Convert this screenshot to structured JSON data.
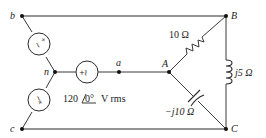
{
  "diagram": {
    "type": "three-phase-circuit",
    "nodes": {
      "b": {
        "label": "b",
        "x": 22,
        "y": 16
      },
      "n": {
        "label": "n",
        "x": 55,
        "y": 72
      },
      "c": {
        "label": "c",
        "x": 22,
        "y": 129
      },
      "a": {
        "label": "a",
        "x": 119,
        "y": 72
      },
      "A": {
        "label": "A",
        "x": 169,
        "y": 72
      },
      "B": {
        "label": "B",
        "x": 226,
        "y": 16
      },
      "C": {
        "label": "C",
        "x": 226,
        "y": 129
      }
    },
    "sources": [
      {
        "name": "source-bn",
        "symbol": "±∼",
        "between": [
          "b",
          "n"
        ]
      },
      {
        "name": "source-cn",
        "symbol": "±∼",
        "between": [
          "c",
          "n"
        ]
      },
      {
        "name": "source-an",
        "symbol": "±∼",
        "between": [
          "n",
          "a"
        ]
      }
    ],
    "source_label": {
      "magnitude": "120",
      "angle": "0°",
      "unit": "V rms"
    },
    "impedances": {
      "AB": {
        "label": "10 Ω",
        "kind": "resistor"
      },
      "BC": {
        "label": "j5 Ω",
        "kind": "inductor"
      },
      "AC": {
        "label": "−j10 Ω",
        "kind": "capacitor"
      }
    }
  }
}
